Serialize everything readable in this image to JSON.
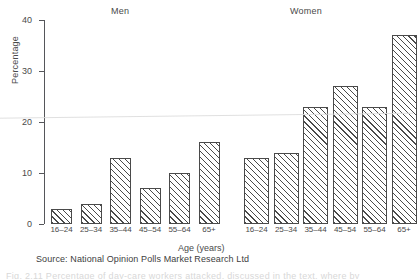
{
  "figure": {
    "source_note": "Source: National Opinion Polls Market Research Ltd",
    "bottom_caption": "Fig. 2.11   Percentage of day-care workers attacked, discussed in the text, where by"
  },
  "chart_data": {
    "type": "bar",
    "title": "",
    "xlabel": "Age (years)",
    "ylabel": "Percentage",
    "ylim": [
      0,
      40
    ],
    "yticks": [
      0,
      10,
      20,
      30,
      40
    ],
    "ytick_labels": [
      "0",
      "10",
      "20",
      "30",
      "40"
    ],
    "grid": false,
    "legend": "none",
    "panels": [
      {
        "name": "Men",
        "categories": [
          "16–24",
          "25–34",
          "35–44",
          "45–54",
          "55–64",
          "65+"
        ],
        "values": [
          3,
          4,
          13,
          7,
          10,
          16
        ]
      },
      {
        "name": "Women",
        "categories": [
          "16–24",
          "25–34",
          "35–44",
          "45–54",
          "55–64",
          "65+"
        ],
        "values": [
          13,
          14,
          23,
          27,
          23,
          37
        ]
      }
    ],
    "colors": {
      "bar_fill": "#ffffff",
      "bar_edge": "#4a4a4a",
      "hatch": "diagonal-45",
      "axis": "#55565a",
      "text": "#4a4a4a"
    }
  }
}
